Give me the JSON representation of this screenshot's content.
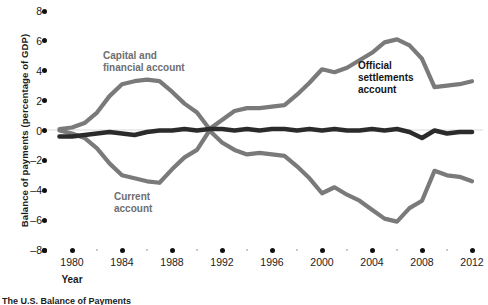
{
  "chart_data": {
    "type": "line",
    "title": "",
    "xlabel": "Year",
    "ylabel": "Balance of payments (percentage of GDP)",
    "xlim": [
      1979,
      2013
    ],
    "ylim": [
      -8,
      8
    ],
    "ytick_values": [
      8,
      6,
      4,
      2,
      0,
      -2,
      -4,
      -6,
      -8
    ],
    "ytick_labels": [
      "8",
      "6",
      "4",
      "2",
      "0",
      "-2",
      "-4",
      "-6",
      "-8"
    ],
    "xtick_values": [
      1980,
      1984,
      1988,
      1992,
      1996,
      2000,
      2004,
      2008,
      2012
    ],
    "xtick_labels": [
      "1980",
      "1984",
      "1988",
      "1992",
      "1996",
      "2000",
      "2004",
      "2008",
      "2012"
    ],
    "grid": false,
    "legend_position": "in-plot annotations",
    "x": [
      1979,
      1980,
      1981,
      1982,
      1983,
      1984,
      1985,
      1986,
      1987,
      1988,
      1989,
      1990,
      1991,
      1992,
      1993,
      1994,
      1995,
      1996,
      1997,
      1998,
      1999,
      2000,
      2001,
      2002,
      2003,
      2004,
      2005,
      2006,
      2007,
      2008,
      2009,
      2010,
      2011,
      2012
    ],
    "series": [
      {
        "name": "Capital and financial account",
        "color": "#7a7a7a",
        "label_text": "Capital and\nfinancial account",
        "values": [
          0.1,
          0.2,
          0.5,
          1.2,
          2.3,
          3.1,
          3.3,
          3.4,
          3.3,
          2.6,
          1.8,
          1.2,
          0.1,
          0.7,
          1.3,
          1.5,
          1.5,
          1.6,
          1.7,
          2.4,
          3.2,
          4.1,
          3.9,
          4.2,
          4.7,
          5.2,
          5.9,
          6.1,
          5.7,
          4.8,
          2.9,
          3.0,
          3.1,
          3.3
        ]
      },
      {
        "name": "Current account",
        "color": "#7a7a7a",
        "label_text": "Current\naccount",
        "values": [
          0.0,
          -0.2,
          -0.5,
          -1.2,
          -2.2,
          -3.0,
          -3.2,
          -3.4,
          -3.5,
          -2.6,
          -1.8,
          -1.3,
          0.0,
          -0.8,
          -1.3,
          -1.6,
          -1.5,
          -1.6,
          -1.7,
          -2.4,
          -3.2,
          -4.2,
          -3.8,
          -4.3,
          -4.7,
          -5.3,
          -5.9,
          -6.1,
          -5.2,
          -4.7,
          -2.7,
          -3.0,
          -3.1,
          -3.4
        ]
      },
      {
        "name": "Official settlements account",
        "color": "#2b2b2b",
        "label_text": "Official\nsettlements\naccount",
        "values": [
          -0.4,
          -0.4,
          -0.3,
          -0.2,
          -0.1,
          -0.2,
          -0.3,
          -0.1,
          0.0,
          0.0,
          0.1,
          0.0,
          0.1,
          0.1,
          0.0,
          0.1,
          0.0,
          0.1,
          0.1,
          0.0,
          0.1,
          0.0,
          0.1,
          0.0,
          0.0,
          0.1,
          0.0,
          0.1,
          -0.1,
          -0.5,
          0.0,
          -0.2,
          -0.1,
          -0.1
        ]
      }
    ],
    "annotations": [
      {
        "name": "capital-and-financial-account-label",
        "text": "Capital and\nfinancial account",
        "x_px": 103,
        "y_px": 50,
        "style": "gray"
      },
      {
        "name": "current-account-label",
        "text": "Current\naccount",
        "x_px": 114,
        "y_px": 191,
        "style": "gray"
      },
      {
        "name": "official-settlements-account-label",
        "text": "Official\nsettlements\naccount",
        "x_px": 358,
        "y_px": 60,
        "style": "dark"
      }
    ]
  },
  "caption": "The U.S. Balance of Payments"
}
